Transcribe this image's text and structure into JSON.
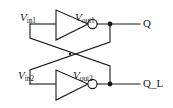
{
  "figure": {
    "background_color": "#ffffff",
    "line_color": "#1a1a1a",
    "width": 173,
    "height": 108
  },
  "labels": {
    "vin1": {
      "symbol": "V",
      "subscript": "in1"
    },
    "vout1": {
      "symbol": "V",
      "subscript": "out1"
    },
    "vin2": {
      "symbol": "V",
      "subscript": "in2"
    },
    "vout2": {
      "symbol": "V",
      "subscript": "out2"
    }
  },
  "ports": {
    "q": "Q",
    "q_l": "Q_L"
  },
  "components": [
    {
      "name": "inverter-top",
      "type": "inverter",
      "input": "V_in1",
      "output": "V_out1"
    },
    {
      "name": "inverter-bottom",
      "type": "inverter",
      "input": "V_in2",
      "output": "V_out2"
    }
  ],
  "nodes": [
    {
      "name": "q-node",
      "label": "Q",
      "x": 110,
      "y": 24
    },
    {
      "name": "q-l-node",
      "label": "Q_L",
      "x": 110,
      "y": 84
    }
  ]
}
